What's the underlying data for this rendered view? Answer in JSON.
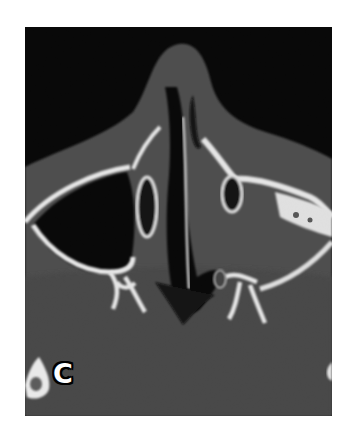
{
  "figure": {
    "panel_label": "C",
    "modality": "axial CT slice, bone window",
    "colors": {
      "background": "#000000",
      "soft_tissue": "#4a4a4a",
      "bone": "#f2f2f2",
      "page": "#ffffff"
    }
  }
}
